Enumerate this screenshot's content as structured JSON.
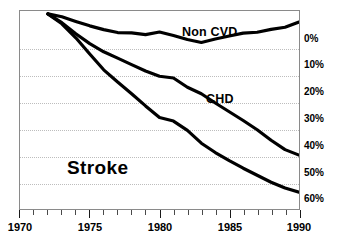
{
  "chart_data": {
    "type": "line",
    "title": "",
    "subtitle": "",
    "xlabel": "",
    "ylabel": "",
    "xlim": [
      1970,
      1990
    ],
    "ylim": [
      -65,
      3
    ],
    "y_inverted": true,
    "grid": true,
    "grid_axis": "y",
    "legend": "inline-annotations",
    "x_ticks_major": [
      1970,
      1975,
      1980,
      1985,
      1990
    ],
    "x_tick_labels": [
      "1970",
      "1975",
      "1980",
      "1985",
      "1990"
    ],
    "x_minor_tick_interval": 1,
    "y_ticks": [
      0,
      -10,
      -20,
      -30,
      -40,
      -50,
      -60
    ],
    "y_tick_labels": [
      "0%",
      "10%",
      "20%",
      "30%",
      "40%",
      "50%",
      "60%"
    ],
    "x": [
      1972,
      1973,
      1974,
      1975,
      1976,
      1977,
      1978,
      1979,
      1980,
      1981,
      1982,
      1983,
      1984,
      1985,
      1986,
      1987,
      1988,
      1989,
      1990
    ],
    "series": [
      {
        "name": "Non CVD",
        "label": "Non CVD",
        "color": "#000000",
        "values": [
          2.0,
          1.0,
          -0.6,
          -2.1,
          -3.4,
          -4.4,
          -4.5,
          -5.1,
          -4.2,
          -5.4,
          -6.8,
          -7.8,
          -6.6,
          -5.6,
          -4.6,
          -4.3,
          -3.3,
          -2.6,
          -0.8
        ]
      },
      {
        "name": "CHD",
        "label": "CHD",
        "color": "#000000",
        "values": [
          2.0,
          -1.0,
          -4.8,
          -8.2,
          -11.0,
          -13.2,
          -15.4,
          -17.6,
          -19.4,
          -20.0,
          -23.2,
          -25.4,
          -28.6,
          -31.6,
          -34.6,
          -37.8,
          -41.4,
          -44.6,
          -46.5
        ]
      },
      {
        "name": "Stroke",
        "label": "Stroke",
        "color": "#000000",
        "values": [
          2.0,
          -1.4,
          -6.2,
          -11.8,
          -17.2,
          -21.4,
          -25.4,
          -29.6,
          -33.6,
          -34.8,
          -38.0,
          -42.4,
          -45.6,
          -48.4,
          -51.0,
          -53.4,
          -55.8,
          -57.8,
          -59.2
        ]
      }
    ],
    "annotations": [
      {
        "text": "Non CVD",
        "x": 1983.0,
        "y": -1.0
      },
      {
        "text": "CHD",
        "x": 1984.5,
        "y": -17.0
      },
      {
        "text": "Stroke",
        "x": 1974.0,
        "y": -45.0
      }
    ]
  },
  "axes": {
    "y_tick_labels": [
      "0%",
      "10%",
      "20%",
      "30%",
      "40%",
      "50%",
      "60%"
    ],
    "x_tick_labels": [
      "1970",
      "1975",
      "1980",
      "1985",
      "1990"
    ]
  },
  "colors": {
    "line": "#000000",
    "frame": "#8a8a8a",
    "grid": "#bdbdbd",
    "background": "#ffffff",
    "text": "#000000"
  }
}
